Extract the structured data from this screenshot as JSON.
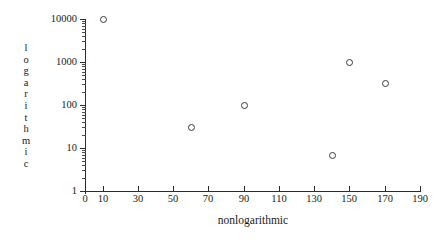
{
  "chart_data": {
    "type": "scatter",
    "title": "",
    "xlabel": "nonlogarithmic",
    "ylabel": "logarithmic",
    "xscale": "linear",
    "yscale": "log",
    "xlim": [
      0,
      190
    ],
    "ylim": [
      1,
      10000
    ],
    "grid": false,
    "legend": null,
    "x_ticks": [
      0,
      10,
      30,
      50,
      70,
      90,
      110,
      130,
      150,
      170,
      190
    ],
    "x_tick_labels": [
      "0",
      "10",
      "30",
      "50",
      "70",
      "90",
      "110",
      "130",
      "150",
      "170",
      "190"
    ],
    "y_ticks": [
      1,
      10,
      100,
      1000,
      10000
    ],
    "y_tick_labels": [
      "1",
      "10",
      "100",
      "1000",
      "10000"
    ],
    "y_minor_ticks": true,
    "marker": "open-circle",
    "marker_color": "#3a3a3a",
    "points": [
      {
        "x": 10,
        "y": 10000
      },
      {
        "x": 60,
        "y": 30
      },
      {
        "x": 90,
        "y": 100
      },
      {
        "x": 140,
        "y": 7
      },
      {
        "x": 150,
        "y": 1000
      },
      {
        "x": 170,
        "y": 330
      }
    ],
    "x_values": [
      10,
      60,
      90,
      140,
      150,
      170
    ],
    "y_values": [
      10000,
      30,
      100,
      7,
      1000,
      330
    ]
  },
  "axes": {
    "x_title": "nonlogarithmic",
    "y_title_chars": [
      "l",
      "o",
      "g",
      "a",
      "r",
      "i",
      "t",
      "h",
      "m",
      "i",
      "c"
    ]
  },
  "colors": {
    "axis": "#2b2b2b",
    "text": "#1a1a1a",
    "marker": "#3a3a3a",
    "background": "#ffffff"
  }
}
